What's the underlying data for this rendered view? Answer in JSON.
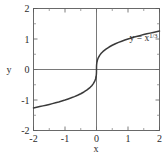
{
  "chart_data": {
    "type": "line",
    "title": "",
    "subtitle": "",
    "xlabel": "x",
    "ylabel": "y",
    "xlim": [
      -2,
      2
    ],
    "ylim": [
      -2,
      2
    ],
    "grid": false,
    "legend": "none",
    "x_ticks": [
      -2,
      -1,
      0,
      1,
      2
    ],
    "x_tick_labels": [
      "-2",
      "-1",
      "0",
      "1",
      "2"
    ],
    "y_ticks": [
      -2,
      -1,
      0,
      1,
      2
    ],
    "y_tick_labels": [
      "-2",
      "-1",
      "0",
      "1",
      "2"
    ],
    "x_minor_ticks": [
      -1.5,
      -0.5,
      0.5,
      1.5
    ],
    "y_minor_ticks": [
      -1.5,
      -0.5,
      0.5,
      1.5
    ],
    "annotations": [
      {
        "text": "y = x",
        "superscript": "1/3",
        "x": 1.05,
        "y": 0.93
      }
    ],
    "series": [
      {
        "name": "y = x^(1/3)",
        "equation": "cube-root",
        "color": "#3a3a3a",
        "x": [
          -2.0,
          -1.9,
          -1.8,
          -1.7,
          -1.6,
          -1.5,
          -1.4,
          -1.3,
          -1.2,
          -1.1,
          -1.0,
          -0.9,
          -0.8,
          -0.7,
          -0.6,
          -0.5,
          -0.4,
          -0.3,
          -0.2,
          -0.15,
          -0.1,
          -0.06,
          -0.03,
          -0.012,
          -0.004,
          -0.001,
          0.0,
          0.001,
          0.004,
          0.012,
          0.03,
          0.06,
          0.1,
          0.15,
          0.2,
          0.3,
          0.4,
          0.5,
          0.6,
          0.7,
          0.8,
          0.9,
          1.0,
          1.1,
          1.2,
          1.3,
          1.4,
          1.5,
          1.6,
          1.7,
          1.8,
          1.9,
          2.0
        ],
        "y": [
          -1.26,
          -1.239,
          -1.216,
          -1.193,
          -1.17,
          -1.145,
          -1.119,
          -1.091,
          -1.063,
          -1.032,
          -1.0,
          -0.965,
          -0.928,
          -0.888,
          -0.843,
          -0.794,
          -0.737,
          -0.669,
          -0.585,
          -0.531,
          -0.464,
          -0.391,
          -0.311,
          -0.229,
          -0.159,
          -0.1,
          0.0,
          0.1,
          0.159,
          0.229,
          0.311,
          0.391,
          0.464,
          0.531,
          0.585,
          0.669,
          0.737,
          0.794,
          0.843,
          0.888,
          0.928,
          0.965,
          1.0,
          1.032,
          1.063,
          1.091,
          1.119,
          1.145,
          1.17,
          1.193,
          1.216,
          1.239,
          1.26
        ]
      }
    ]
  }
}
